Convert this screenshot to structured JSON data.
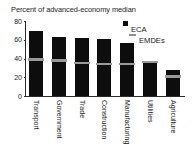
{
  "chart_data": {
    "type": "bar",
    "title": "Percent of advanced-economy median",
    "xlabel": "",
    "ylabel": "",
    "ylim": [
      0,
      80
    ],
    "yticks": [
      0,
      20,
      40,
      60,
      80
    ],
    "grid": false,
    "legend_position": "top-right",
    "categories": [
      "Transport",
      "Government",
      "Trade",
      "Construction",
      "Manufacturing",
      "Utilities",
      "Agriculture"
    ],
    "series": [
      {
        "name": "ECA",
        "type": "bar",
        "color": "#0d0d0d",
        "marker": "square",
        "values": [
          69,
          63,
          62,
          61,
          57,
          37,
          28
        ]
      },
      {
        "name": "EMDEs",
        "type": "marker-line",
        "color": "#9a9a9a",
        "marker": "dash",
        "values": [
          39,
          38,
          35,
          34,
          34,
          36,
          21
        ]
      }
    ]
  },
  "legend": {
    "items": [
      {
        "label": "ECA",
        "marker": "square-marker"
      },
      {
        "label": "EMDEs",
        "marker": "dash-marker"
      }
    ]
  },
  "colors": {
    "eca_bar": "#0d0d0d",
    "emdes_marker": "#9a9a9a",
    "axis": "#2b2b2b",
    "text": "#1a1a1a",
    "background": "#ffffff"
  }
}
